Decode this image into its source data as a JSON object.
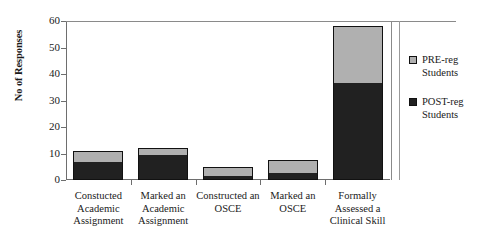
{
  "chart_data": {
    "type": "bar",
    "stacked": true,
    "title": "",
    "xlabel": "",
    "ylabel": "No of Responses",
    "ylim": [
      0,
      60
    ],
    "yticks": [
      0,
      10,
      20,
      30,
      40,
      50,
      60
    ],
    "grid": false,
    "legend_position": "right",
    "categories": [
      "Constucted Academic Assignment",
      "Marked an Academic Assignment",
      "Constructed an OSCE",
      "Marked an OSCE",
      "Formally Assessed a Clinical Skill"
    ],
    "category_lines": [
      [
        "Constucted",
        "Academic",
        "Assignment"
      ],
      [
        "Marked an",
        "Academic",
        "Assignment"
      ],
      [
        "Constructed an",
        "OSCE"
      ],
      [
        "Marked an",
        "OSCE"
      ],
      [
        "Formally",
        "Assessed a",
        "Clinical Skill"
      ]
    ],
    "series": [
      {
        "name": "POST-reg Students",
        "color": "#212121",
        "values": [
          7,
          10,
          2,
          3,
          37
        ]
      },
      {
        "name": "PRE-reg Students",
        "color": "#b0b0b0",
        "values": [
          4,
          2,
          3,
          4.5,
          21
        ]
      }
    ],
    "totals": [
      11,
      12,
      5,
      7.5,
      58
    ]
  },
  "axis": {
    "y_title": "No of Responses",
    "y_tick_labels": [
      "60",
      "50",
      "40",
      "30",
      "20",
      "10",
      "0"
    ]
  },
  "legend": {
    "entries": [
      {
        "label_line1": "PRE-reg",
        "label_line2": "Students",
        "swatch": "#b0b0b0"
      },
      {
        "label_line1": "POST-reg",
        "label_line2": "Students",
        "swatch": "#212121"
      }
    ]
  },
  "colors": {
    "pre_reg": "#b0b0b0",
    "post_reg": "#212121",
    "axis": "#6e6e6e",
    "text": "#1a1a1a",
    "background": "#ffffff"
  }
}
